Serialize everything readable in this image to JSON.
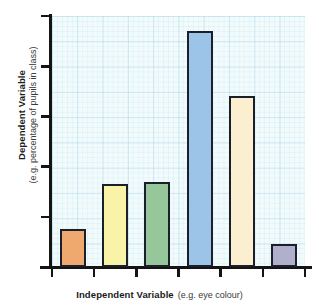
{
  "chart_data": {
    "type": "bar",
    "title": "",
    "subtitle": "",
    "xlabel": "Independent Variable",
    "xlabel_example": "(e.g. eye colour)",
    "ylabel": "Dependent Variable",
    "ylabel_example": "(e.g. percentage of pupils in class)",
    "categories": [
      "1",
      "2",
      "3",
      "4",
      "5",
      "6"
    ],
    "values": [
      15,
      33,
      34,
      94,
      68,
      9
    ],
    "ylim": [
      0,
      100
    ],
    "xlim": [
      0,
      6
    ],
    "grid": true,
    "grid_style": "graph-paper",
    "legend": "none",
    "tick_labels_x": [],
    "tick_labels_y": [],
    "y_tick_count": 6,
    "x_tick_count": 7,
    "bar_colors": [
      "#EFA96E",
      "#F9F3A8",
      "#96C79A",
      "#9CC3E8",
      "#FBEFD0",
      "#B0B0CC"
    ],
    "bar_edge_color": "#1A1F2B",
    "plot_background": "#F2FBFC",
    "axis_color": "#141414",
    "series": [
      {
        "name": "Dependent Variable",
        "values": [
          15,
          33,
          34,
          94,
          68,
          9
        ]
      }
    ],
    "bars": [
      {
        "category": "1",
        "value": 15,
        "color": "#EFA96E"
      },
      {
        "category": "2",
        "value": 33,
        "color": "#F9F3A8"
      },
      {
        "category": "3",
        "value": 34,
        "color": "#96C79A"
      },
      {
        "category": "4",
        "value": 94,
        "color": "#9CC3E8"
      },
      {
        "category": "5",
        "value": 68,
        "color": "#FBEFD0"
      },
      {
        "category": "6",
        "value": 9,
        "color": "#B0B0CC"
      }
    ]
  }
}
